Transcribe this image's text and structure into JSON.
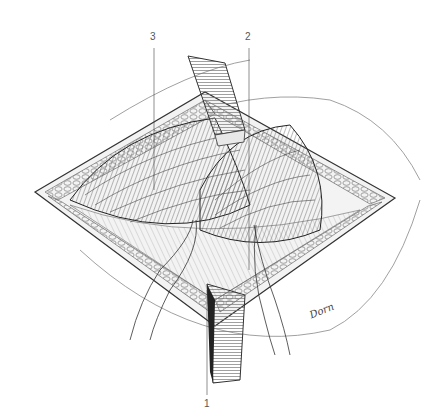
{
  "figure": {
    "type": "surgical anatomical illustration",
    "style": "monochrome pen-and-ink",
    "colors": {
      "background": "#ffffff",
      "ink": "#2a2a2a",
      "shade": "#8a8a8a",
      "light": "#cfcfcf"
    },
    "labels": [
      {
        "id": "3",
        "text": "3",
        "x": 152,
        "y": 42,
        "leader_to": [
          154,
          190
        ]
      },
      {
        "id": "2",
        "text": "2",
        "x": 247,
        "y": 42,
        "leader_to": [
          249,
          270
        ]
      },
      {
        "id": "1",
        "text": "1",
        "x": 206,
        "y": 404,
        "leader_to": [
          207,
          290
        ]
      }
    ],
    "signature": "Dorn",
    "elements": [
      "diamond-shaped incision",
      "upper retractor",
      "lower retractor",
      "exposed muscle fibers",
      "fat lobules along wound edges",
      "two traction sutures"
    ]
  }
}
